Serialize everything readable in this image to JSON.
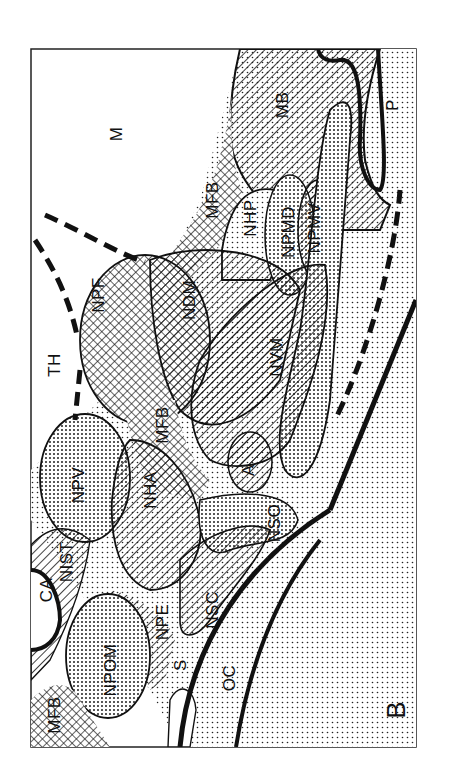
{
  "figure": {
    "panel_letter": "B",
    "orientation": "rotated 90 degrees counter-clockwise",
    "colors": {
      "ink": "#111111",
      "background": "#ffffff"
    },
    "patterns": {
      "diagonal_hatch": "hatched regions",
      "crosshatch": "cross-hatched regions",
      "fine_stipple": "lightly dotted regions",
      "dense_stipple": "densely dotted regions"
    },
    "labels": {
      "M": "M",
      "P": "P",
      "MB": "MB",
      "MFB_top": "MFB",
      "NHP": "NHP",
      "NPMD": "NPMD",
      "NPMV": "NPMV",
      "TH": "TH",
      "NPF": "NPF",
      "NDM": "NDM",
      "NVM": "NVM",
      "MFB_mid": "MFB",
      "A": "A",
      "NPV": "NPV",
      "NHA": "NHA",
      "NSO": "NSO",
      "CA": "CA",
      "NIST": "NIST",
      "NPE": "NPE",
      "NSC": "NSC",
      "NPOM": "NPOM",
      "MFB_bottom": "MFB",
      "S": "S",
      "OC": "OC"
    }
  }
}
